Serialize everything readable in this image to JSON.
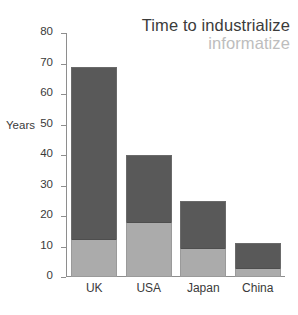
{
  "chart_data": {
    "type": "bar",
    "stacked": true,
    "title": "Time to industrialize",
    "subtitle": "informatize",
    "xlabel": "",
    "ylabel": "Years",
    "ylim": [
      0,
      80
    ],
    "yticks": [
      0,
      10,
      20,
      30,
      40,
      50,
      60,
      70,
      80
    ],
    "ytick_labels": [
      "0",
      "10",
      "20",
      "30",
      "40",
      "50",
      "60",
      "70",
      "80"
    ],
    "grid": false,
    "legend_position": "none",
    "categories": [
      "UK",
      "USA",
      "Japan",
      "China"
    ],
    "series": [
      {
        "name": "informatize",
        "color": "#ababab",
        "values": [
          12.5,
          18,
          9.5,
          3
        ]
      },
      {
        "name": "industrialize",
        "color": "#595959",
        "values": [
          56.5,
          22,
          15.5,
          8
        ]
      }
    ],
    "totals": [
      69,
      40,
      25,
      11
    ]
  },
  "colors": {
    "dark_segment": "#595959",
    "light_segment": "#ababab",
    "title_main": "#3b3b3b",
    "title_sub": "#bdbdbd",
    "axis": "#8e8e8e",
    "background": "#ffffff"
  }
}
